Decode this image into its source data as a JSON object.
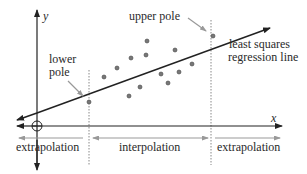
{
  "diagram": {
    "axes": {
      "x_label": "x",
      "y_label": "y"
    },
    "labels": {
      "upper_pole": "upper pole",
      "lower_pole_line1": "lower",
      "lower_pole_line2": "pole",
      "regression_line1": "least squares",
      "regression_line2": "regression line",
      "extrapolation_left": "extrapolation",
      "interpolation": "interpolation",
      "extrapolation_right": "extrapolation"
    },
    "colors": {
      "line": "#222222",
      "gray_arrow": "#999999",
      "point_fill": "#777777",
      "dotted": "#888888"
    },
    "points": [
      [
        89,
        102
      ],
      [
        104,
        77
      ],
      [
        117,
        68
      ],
      [
        131,
        58
      ],
      [
        147,
        41
      ],
      [
        146,
        55
      ],
      [
        175,
        50
      ],
      [
        192,
        64
      ],
      [
        161,
        74
      ],
      [
        168,
        83
      ],
      [
        179,
        72
      ],
      [
        129,
        96
      ],
      [
        140,
        87
      ],
      [
        213,
        36
      ]
    ]
  }
}
